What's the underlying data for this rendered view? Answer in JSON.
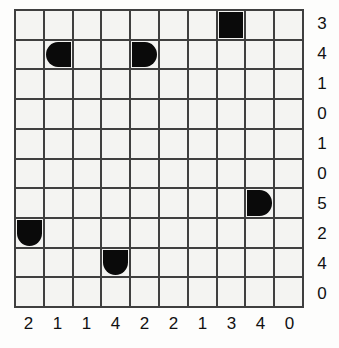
{
  "puzzle": {
    "title": "Nonogram-style 10x10 grid puzzle",
    "grid": {
      "rows": 10,
      "columns": 10,
      "background_color": "#f4f4f2",
      "line_color": "#3f3f3f",
      "piece_color": "#0a0a0a"
    },
    "row_labels": [
      "3",
      "4",
      "1",
      "0",
      "1",
      "0",
      "5",
      "2",
      "4",
      "0"
    ],
    "column_labels": [
      "2",
      "1",
      "1",
      "4",
      "2",
      "2",
      "1",
      "3",
      "4",
      "0"
    ],
    "pieces": [
      {
        "row": 0,
        "col": 7,
        "shape": "square",
        "name": "piece-square-r0c7"
      },
      {
        "row": 1,
        "col": 1,
        "shape": "d-left",
        "name": "piece-d-left-r1c1"
      },
      {
        "row": 1,
        "col": 4,
        "shape": "d-right",
        "name": "piece-d-right-r1c4"
      },
      {
        "row": 6,
        "col": 8,
        "shape": "d-right",
        "name": "piece-d-right-r6c8"
      },
      {
        "row": 7,
        "col": 0,
        "shape": "d-down",
        "name": "piece-d-down-r7c0"
      },
      {
        "row": 8,
        "col": 3,
        "shape": "d-down",
        "name": "piece-d-down-r8c3"
      }
    ]
  },
  "chart_data": {
    "type": "heatmap",
    "title": "",
    "xlabel": "",
    "ylabel": "",
    "x": [
      "2",
      "1",
      "1",
      "4",
      "2",
      "2",
      "1",
      "3",
      "4",
      "0"
    ],
    "y": [
      "3",
      "4",
      "1",
      "0",
      "1",
      "0",
      "5",
      "2",
      "4",
      "0"
    ],
    "values": [
      [
        0,
        0,
        0,
        0,
        0,
        0,
        0,
        1,
        0,
        0
      ],
      [
        0,
        1,
        0,
        0,
        1,
        0,
        0,
        0,
        0,
        0
      ],
      [
        0,
        0,
        0,
        0,
        0,
        0,
        0,
        0,
        0,
        0
      ],
      [
        0,
        0,
        0,
        0,
        0,
        0,
        0,
        0,
        0,
        0
      ],
      [
        0,
        0,
        0,
        0,
        0,
        0,
        0,
        0,
        0,
        0
      ],
      [
        0,
        0,
        0,
        0,
        0,
        0,
        0,
        0,
        0,
        0
      ],
      [
        0,
        0,
        0,
        0,
        0,
        0,
        0,
        0,
        1,
        0
      ],
      [
        1,
        0,
        0,
        0,
        0,
        0,
        0,
        0,
        0,
        0
      ],
      [
        0,
        0,
        0,
        1,
        0,
        0,
        0,
        0,
        0,
        0
      ],
      [
        0,
        0,
        0,
        0,
        0,
        0,
        0,
        0,
        0,
        0
      ]
    ],
    "grid": true,
    "legend": "none"
  }
}
